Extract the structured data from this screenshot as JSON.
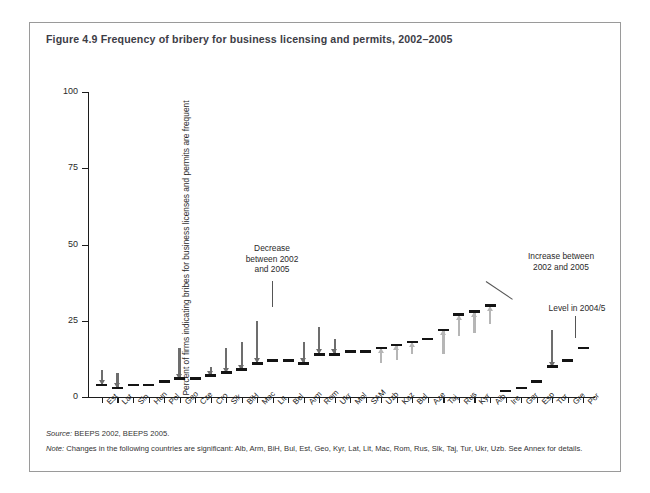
{
  "figure": {
    "title": "Figure 4.9  Frequency of bribery for business licensing and permits, 2002–2005",
    "source_label": "Source:",
    "source_text": " BEEPS 2002, BEEPS 2005.",
    "note_label": "Note:",
    "note_text": " Changes in the following countries are significant: Alb, Arm, BiH, Bul, Est, Geo, Kyr, Lat, Lit, Mac, Rom, Rus, Slk, Taj, Tur, Ukr, Uzb. See Annex for details."
  },
  "annotations": {
    "decrease": "Decrease\nbetween 2002\nand 2005",
    "increase": "Increase between\n2002 and 2005",
    "level": "Level in 2004/5"
  },
  "colors": {
    "decrease_arrow": "#6d6d6d",
    "increase_arrow": "#b6b6b6",
    "level_bar": "#141414",
    "axis": "#1c1c1c",
    "frame": "#9a9a9a",
    "title_text": "#3d3d46"
  },
  "chart_data": {
    "type": "bar",
    "title": "Figure 4.9  Frequency of bribery for business licensing and permits, 2002–2005",
    "subtitle": "",
    "xlabel": "",
    "ylabel": "Percent of firms indicating bribes for business licenses and permits are frequent",
    "ylim": [
      0,
      100
    ],
    "yticks": [
      0,
      25,
      50,
      75,
      100
    ],
    "ytick_labels": [
      "0",
      "25",
      "50",
      "75",
      "100"
    ],
    "grid": false,
    "legend_position": "none",
    "categories": [
      "Est",
      "Lat",
      "Sln",
      "Hun",
      "Pol",
      "Geo",
      "Cze",
      "Cro",
      "Slk",
      "BiH",
      "Mac",
      "Lit",
      "Bel",
      "Arm",
      "Rom",
      "Ukr",
      "Mol",
      "SAM",
      "Uzb",
      "Kaz",
      "Bul",
      "Aze",
      "Taj",
      "Rus",
      "Kyr",
      "Alb",
      "Ire",
      "Ger",
      "Esp",
      "Tur",
      "Gre",
      "Por"
    ],
    "series": [
      {
        "name": "Level in 2004/5",
        "values": [
          4,
          3,
          4,
          4,
          5,
          6,
          6,
          7,
          8,
          9,
          11,
          12,
          12,
          11,
          14,
          14,
          15,
          15,
          16,
          17,
          18,
          19,
          22,
          27,
          28,
          30,
          2,
          3,
          5,
          10,
          12,
          16
        ]
      },
      {
        "name": "Level in 2002",
        "values": [
          9,
          8,
          4,
          4,
          5,
          16,
          6,
          10,
          16,
          18,
          25,
          12,
          12,
          18,
          23,
          19,
          15,
          15,
          11,
          12,
          14,
          19,
          14,
          20,
          21,
          24,
          2,
          3,
          5,
          22,
          12,
          16
        ]
      }
    ],
    "changes": [
      "decrease",
      "decrease",
      "none",
      "none",
      "none",
      "decrease",
      "none",
      "decrease",
      "decrease",
      "decrease",
      "decrease",
      "none",
      "none",
      "decrease",
      "decrease",
      "decrease",
      "none",
      "none",
      "increase",
      "increase",
      "increase",
      "none",
      "increase",
      "increase",
      "increase",
      "increase",
      "none",
      "none",
      "none",
      "decrease",
      "none",
      "none"
    ]
  }
}
